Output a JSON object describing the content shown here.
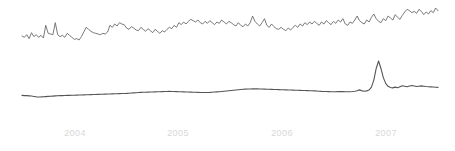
{
  "chart_data": {
    "type": "line",
    "title": "",
    "subtitle": "",
    "xlabel": "",
    "ylabel": "",
    "grid": false,
    "legend": "none",
    "background_color": "#ffffff",
    "axis_label_color": "#d8d8d8",
    "x_tick_labels": [
      "2004",
      "2005",
      "2006",
      "2007"
    ],
    "x_tick_positions_px": [
      75,
      178,
      282,
      386
    ],
    "xlim": [
      "2003-07",
      "2007-09"
    ],
    "series": [
      {
        "name": "upper-series",
        "color": "#6b6b6b",
        "stroke_width": 0.9,
        "ylim": [
          0,
          1
        ],
        "values": [
          0.42,
          0.4,
          0.44,
          0.38,
          0.47,
          0.41,
          0.44,
          0.4,
          0.43,
          0.39,
          0.58,
          0.46,
          0.45,
          0.44,
          0.62,
          0.44,
          0.41,
          0.43,
          0.4,
          0.46,
          0.43,
          0.4,
          0.37,
          0.38,
          0.36,
          0.41,
          0.48,
          0.55,
          0.52,
          0.49,
          0.47,
          0.46,
          0.45,
          0.44,
          0.46,
          0.45,
          0.48,
          0.58,
          0.55,
          0.6,
          0.57,
          0.62,
          0.6,
          0.59,
          0.54,
          0.52,
          0.56,
          0.54,
          0.51,
          0.5,
          0.55,
          0.52,
          0.49,
          0.53,
          0.5,
          0.47,
          0.52,
          0.49,
          0.46,
          0.5,
          0.48,
          0.52,
          0.55,
          0.53,
          0.58,
          0.55,
          0.62,
          0.59,
          0.63,
          0.6,
          0.64,
          0.67,
          0.65,
          0.63,
          0.66,
          0.62,
          0.6,
          0.64,
          0.61,
          0.65,
          0.62,
          0.59,
          0.63,
          0.61,
          0.66,
          0.63,
          0.6,
          0.64,
          0.62,
          0.59,
          0.57,
          0.62,
          0.58,
          0.56,
          0.6,
          0.57,
          0.62,
          0.72,
          0.64,
          0.6,
          0.57,
          0.62,
          0.68,
          0.58,
          0.55,
          0.6,
          0.56,
          0.53,
          0.52,
          0.55,
          0.52,
          0.5,
          0.54,
          0.51,
          0.55,
          0.58,
          0.55,
          0.6,
          0.57,
          0.62,
          0.59,
          0.63,
          0.6,
          0.64,
          0.61,
          0.58,
          0.63,
          0.6,
          0.65,
          0.62,
          0.59,
          0.64,
          0.61,
          0.66,
          0.63,
          0.68,
          0.6,
          0.58,
          0.63,
          0.61,
          0.66,
          0.72,
          0.65,
          0.62,
          0.6,
          0.66,
          0.63,
          0.7,
          0.75,
          0.68,
          0.64,
          0.62,
          0.68,
          0.65,
          0.72,
          0.69,
          0.66,
          0.74,
          0.7,
          0.67,
          0.73,
          0.78,
          0.82,
          0.8,
          0.77,
          0.79,
          0.76,
          0.82,
          0.79,
          0.74,
          0.78,
          0.75,
          0.8,
          0.77,
          0.84,
          0.8
        ]
      },
      {
        "name": "lower-series",
        "color": "#555555",
        "stroke_width": 1.1,
        "ylim": [
          0,
          1
        ],
        "values": [
          0.145,
          0.143,
          0.142,
          0.14,
          0.138,
          0.133,
          0.128,
          0.126,
          0.127,
          0.129,
          0.131,
          0.133,
          0.135,
          0.137,
          0.139,
          0.141,
          0.142,
          0.143,
          0.144,
          0.145,
          0.146,
          0.147,
          0.148,
          0.149,
          0.15,
          0.151,
          0.152,
          0.153,
          0.154,
          0.155,
          0.156,
          0.157,
          0.158,
          0.159,
          0.16,
          0.161,
          0.162,
          0.163,
          0.164,
          0.165,
          0.166,
          0.167,
          0.168,
          0.169,
          0.17,
          0.172,
          0.174,
          0.176,
          0.178,
          0.18,
          0.182,
          0.183,
          0.184,
          0.185,
          0.186,
          0.187,
          0.188,
          0.189,
          0.19,
          0.191,
          0.192,
          0.193,
          0.194,
          0.193,
          0.192,
          0.191,
          0.19,
          0.189,
          0.188,
          0.187,
          0.186,
          0.185,
          0.184,
          0.183,
          0.182,
          0.181,
          0.18,
          0.18,
          0.181,
          0.182,
          0.184,
          0.186,
          0.188,
          0.19,
          0.193,
          0.196,
          0.199,
          0.202,
          0.205,
          0.208,
          0.211,
          0.214,
          0.217,
          0.219,
          0.221,
          0.222,
          0.223,
          0.224,
          0.224,
          0.224,
          0.223,
          0.222,
          0.221,
          0.22,
          0.219,
          0.218,
          0.217,
          0.216,
          0.215,
          0.214,
          0.213,
          0.212,
          0.211,
          0.21,
          0.209,
          0.208,
          0.207,
          0.206,
          0.205,
          0.204,
          0.203,
          0.202,
          0.201,
          0.2,
          0.198,
          0.196,
          0.194,
          0.193,
          0.192,
          0.191,
          0.19,
          0.189,
          0.19,
          0.191,
          0.192,
          0.191,
          0.19,
          0.189,
          0.19,
          0.192,
          0.196,
          0.202,
          0.212,
          0.2,
          0.196,
          0.2,
          0.21,
          0.245,
          0.33,
          0.47,
          0.56,
          0.47,
          0.36,
          0.29,
          0.255,
          0.24,
          0.236,
          0.245,
          0.238,
          0.25,
          0.262,
          0.256,
          0.25,
          0.258,
          0.264,
          0.258,
          0.252,
          0.256,
          0.26,
          0.256,
          0.252,
          0.25,
          0.248,
          0.246,
          0.244,
          0.242
        ]
      }
    ]
  },
  "plot_geometry": {
    "left_px": 22,
    "right_px": 438,
    "upper_band_top_px": 8,
    "upper_band_bottom_px": 40,
    "lower_band_top_px": 61,
    "lower_band_bottom_px": 97,
    "tick_label_baseline_px": 137
  }
}
